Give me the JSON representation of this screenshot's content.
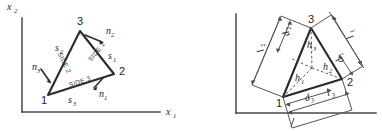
{
  "figure": {
    "kind": "engineering-diagram",
    "background_color": "#ffffff",
    "line_color": "#2b2b2b",
    "axis_color": "#4a4a4a"
  },
  "left_panel": {
    "name": "side-vectors-and-normals",
    "axes": {
      "x_label": "x",
      "x_subscript": "1",
      "y_label": "x",
      "y_subscript": "2"
    },
    "vertices": [
      {
        "label": "1",
        "x": 48,
        "y": 95
      },
      {
        "label": "2",
        "x": 114,
        "y": 74
      },
      {
        "label": "3",
        "x": 80,
        "y": 31
      }
    ],
    "side_labels": [
      {
        "text": "SIDE 1"
      },
      {
        "text": "SIDE 2"
      },
      {
        "text": "SIDE 3"
      }
    ],
    "side_vectors": [
      {
        "symbol": "s",
        "subscript": "1"
      },
      {
        "symbol": "s",
        "subscript": "2"
      },
      {
        "symbol": "s",
        "subscript": "3"
      }
    ],
    "normals": [
      {
        "symbol": "n",
        "subscript": "1"
      },
      {
        "symbol": "n",
        "subscript": "2"
      },
      {
        "symbol": "n",
        "subscript": "3"
      }
    ]
  },
  "right_panel": {
    "name": "bounding-dimensions",
    "axes": {
      "x_label": "",
      "y_label": ""
    },
    "vertices": [
      {
        "label": "1",
        "x": 283,
        "y": 97
      },
      {
        "label": "2",
        "x": 342,
        "y": 79
      },
      {
        "label": "3",
        "x": 311,
        "y": 28
      }
    ],
    "lengths": [
      {
        "symbol": "l",
        "subscript": "1"
      },
      {
        "symbol": "l",
        "subscript": "2"
      },
      {
        "symbol": "l",
        "subscript": "3"
      }
    ],
    "offsets": [
      {
        "symbol": "d",
        "subscript": "1"
      },
      {
        "symbol": "d",
        "subscript": "2"
      },
      {
        "symbol": "d",
        "subscript": "3"
      }
    ],
    "heights": [
      {
        "symbol": "h",
        "subscript": "1"
      },
      {
        "symbol": "h",
        "subscript": "2"
      },
      {
        "symbol": "h",
        "subscript": "3"
      }
    ]
  }
}
